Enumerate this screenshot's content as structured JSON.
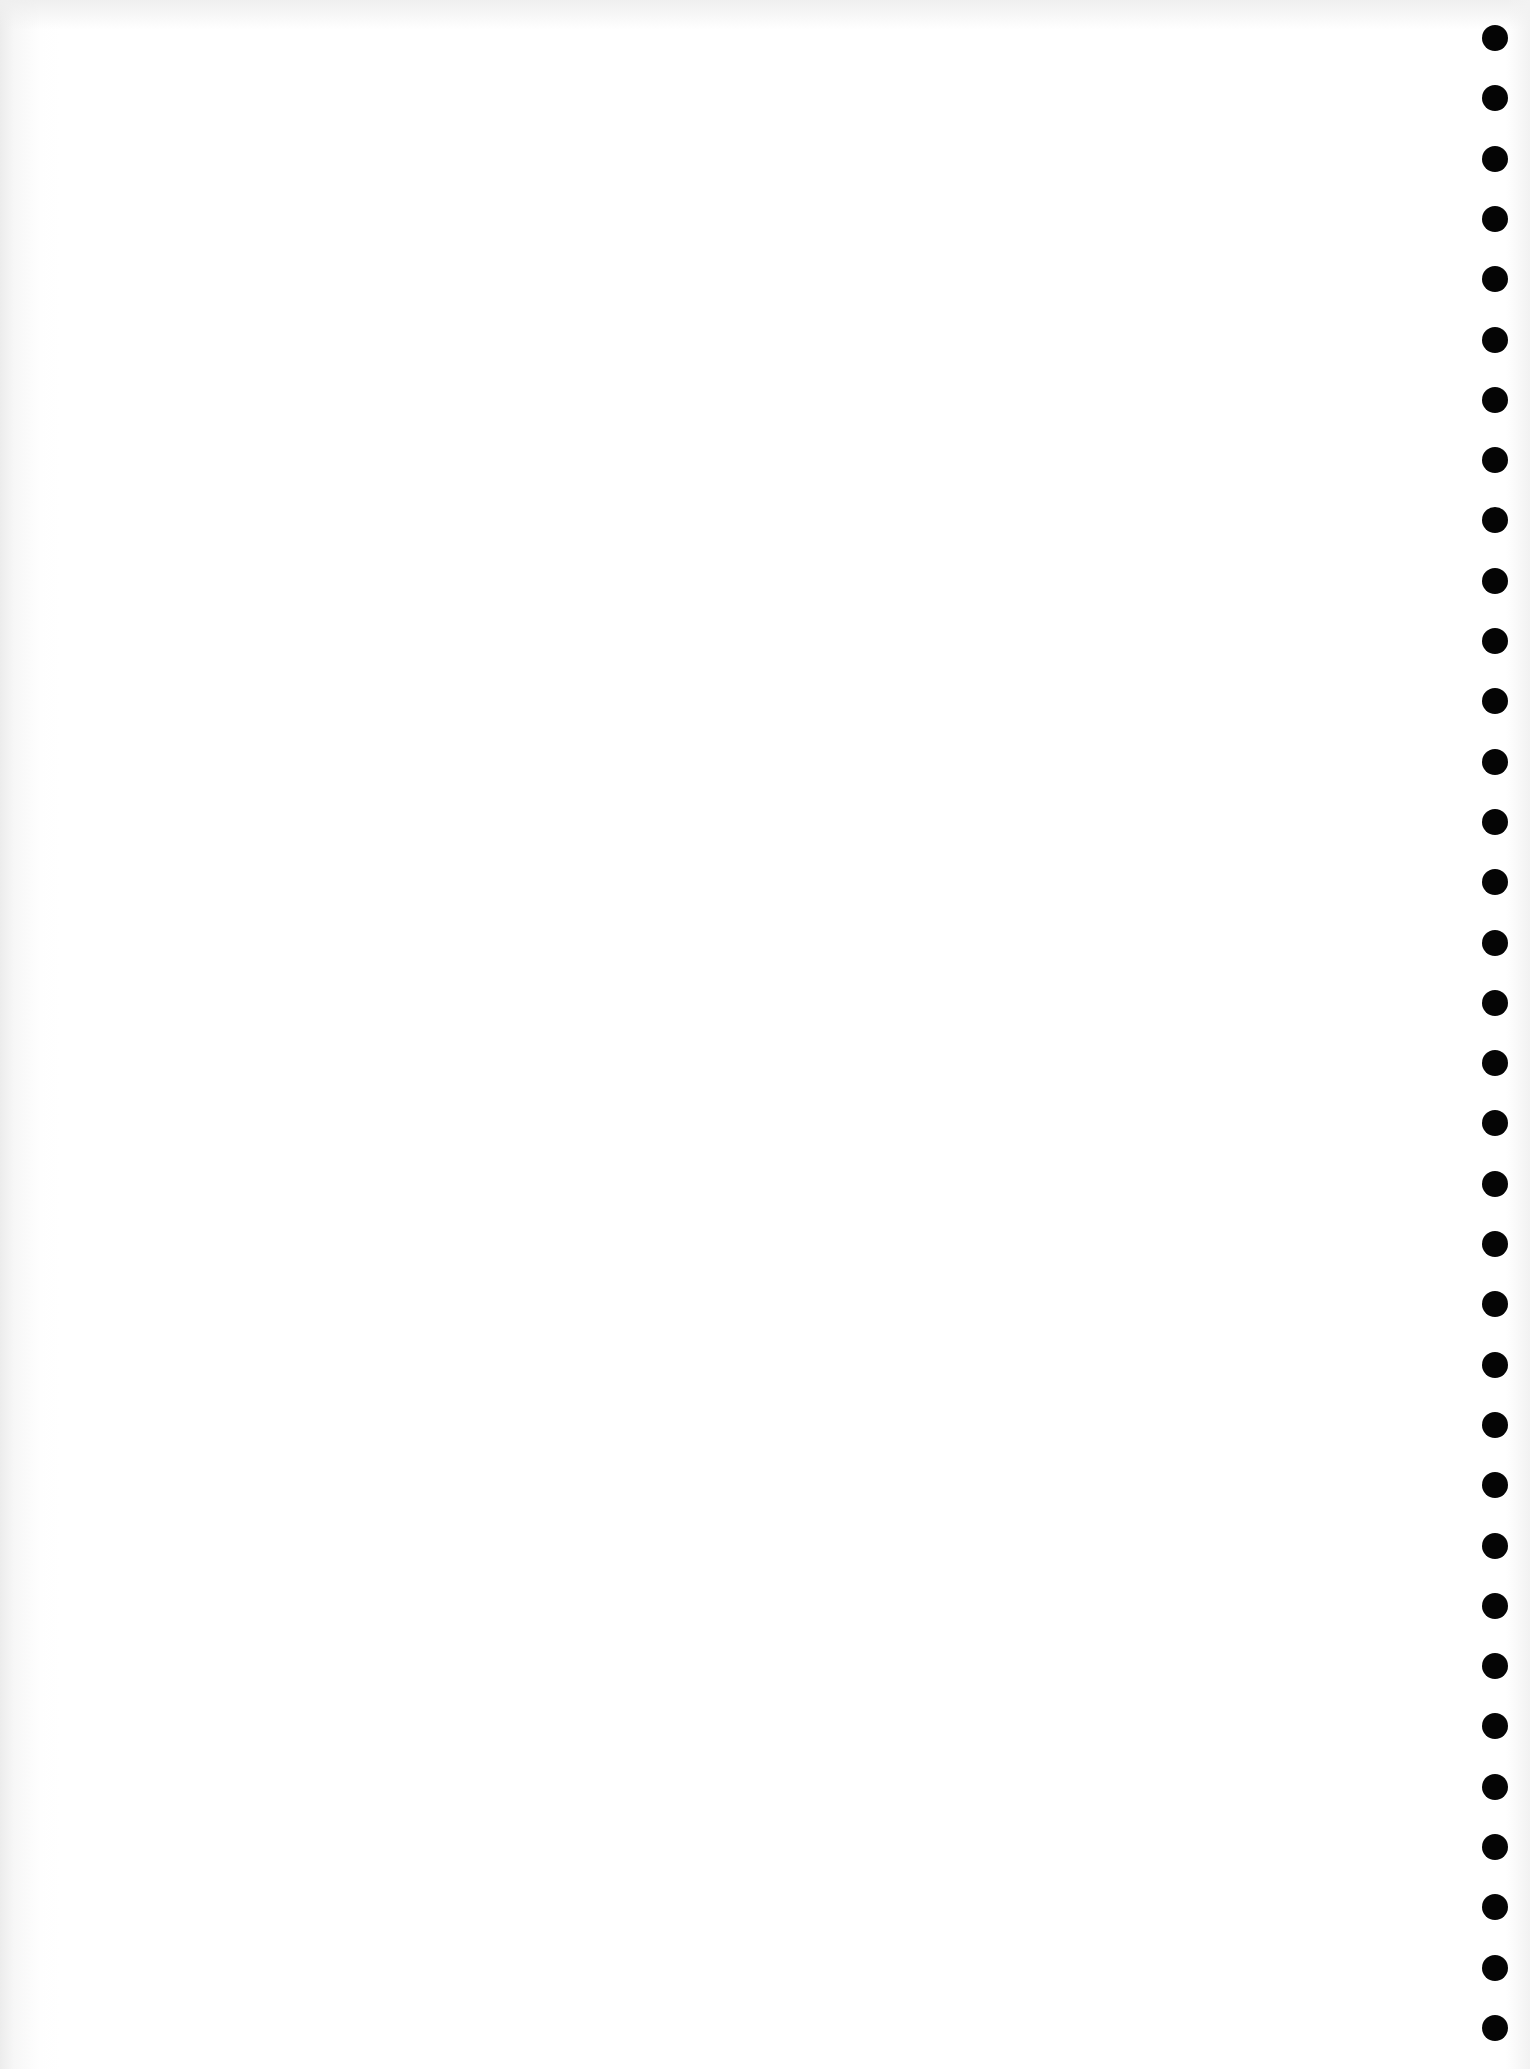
{
  "page": {
    "type": "blank scanned sheet with binder holes",
    "background_color": "#ffffff",
    "text_content": []
  },
  "binder_holes": {
    "count": 34,
    "color": "#050505",
    "column_x": 1495,
    "first_y": 38,
    "spacing": 60.3,
    "diameter": 26
  }
}
